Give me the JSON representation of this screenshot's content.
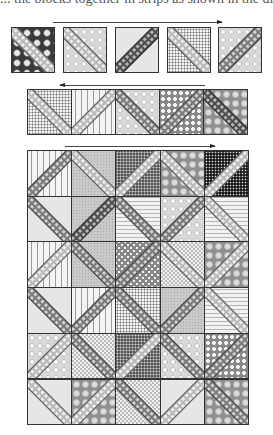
{
  "caption": "... the blocks together in strips as shown in the diagram ...",
  "arrows": [
    {
      "id": "row1",
      "direction": "right",
      "x": 53,
      "y": 22,
      "length": 169
    },
    {
      "id": "row2",
      "direction": "left",
      "x": 60,
      "y": 85,
      "length": 145
    },
    {
      "id": "row3",
      "direction": "right",
      "x": 65,
      "y": 146,
      "length": 150
    }
  ],
  "step1_blocks": [
    {
      "diag": "bwd",
      "bg": "p-floral-dark",
      "band": "b-floral-light"
    },
    {
      "diag": "bwd",
      "bg": "p-floral-light",
      "band": "b-floral-light"
    },
    {
      "diag": "fwd",
      "bg": "p-light",
      "band": "b-floral-dark"
    },
    {
      "diag": "bwd",
      "bg": "p-dots",
      "band": "b-floral-light"
    },
    {
      "diag": "fwd",
      "bg": "p-floral-light",
      "band": "b-floral"
    }
  ],
  "step2_strip": [
    {
      "diag": "bwd",
      "bg": "p-dots",
      "band": "b-floral-light"
    },
    {
      "diag": "fwd",
      "bg": "p-stripes",
      "band": "b-floral-light"
    },
    {
      "diag": "bwd",
      "bg": "p-floral-light",
      "band": "b-floral"
    },
    {
      "diag": "fwd",
      "bg": "p-bigdots",
      "band": "b-floral"
    },
    {
      "diag": "bwd",
      "bg": "p-floral-mid",
      "band": "b-floral-dark"
    }
  ],
  "quilt_grid": {
    "rows": 6,
    "cols": 5,
    "cells": [
      [
        {
          "diag": "fwd",
          "bg": "p-stripes",
          "band": "b-floral"
        },
        {
          "diag": "bwd",
          "bg": "p-grey",
          "band": "b-floral-light"
        },
        {
          "diag": "fwd",
          "bg": "p-darkdots",
          "band": "b-floral-light"
        },
        {
          "diag": "bwd",
          "bg": "p-floral-mid",
          "band": "b-floral-light"
        },
        {
          "diag": "fwd",
          "bg": "p-blackdots",
          "band": "b-floral-light"
        }
      ],
      [
        {
          "diag": "bwd",
          "bg": "p-light",
          "band": "b-floral"
        },
        {
          "diag": "fwd",
          "bg": "p-grey",
          "band": "b-floral-dark"
        },
        {
          "diag": "bwd",
          "bg": "p-hstripes",
          "band": "b-floral"
        },
        {
          "diag": "fwd",
          "bg": "p-floral-light",
          "band": "b-floral"
        },
        {
          "diag": "bwd",
          "bg": "p-hstripes",
          "band": "b-floral-light"
        }
      ],
      [
        {
          "diag": "fwd",
          "bg": "p-stripes",
          "band": "b-floral-light"
        },
        {
          "diag": "bwd",
          "bg": "p-grey",
          "band": "b-floral"
        },
        {
          "diag": "fwd",
          "bg": "p-lattice",
          "band": "b-floral"
        },
        {
          "diag": "bwd",
          "bg": "p-checker",
          "band": "b-floral-light"
        },
        {
          "diag": "fwd",
          "bg": "p-floral-mid",
          "band": "b-floral-light"
        }
      ],
      [
        {
          "diag": "bwd",
          "bg": "p-light",
          "band": "b-floral"
        },
        {
          "diag": "fwd",
          "bg": "p-stripes",
          "band": "b-floral"
        },
        {
          "diag": "bwd",
          "bg": "p-dots",
          "band": "b-floral"
        },
        {
          "diag": "fwd",
          "bg": "p-grey",
          "band": "b-floral"
        },
        {
          "diag": "bwd",
          "bg": "p-hstripes",
          "band": "b-floral-light"
        }
      ],
      [
        {
          "diag": "fwd",
          "bg": "p-floral-light",
          "band": "b-floral-light"
        },
        {
          "diag": "bwd",
          "bg": "p-checker",
          "band": "b-floral"
        },
        {
          "diag": "fwd",
          "bg": "p-darkdots",
          "band": "b-floral-light"
        },
        {
          "diag": "bwd",
          "bg": "p-floral-light",
          "band": "b-floral"
        },
        {
          "diag": "fwd",
          "bg": "p-bigdots",
          "band": "b-floral"
        }
      ],
      [
        {
          "diag": "bwd",
          "bg": "p-light",
          "band": "b-floral-light"
        },
        {
          "diag": "fwd",
          "bg": "p-floral-mid",
          "band": "b-floral-light"
        },
        {
          "diag": "bwd",
          "bg": "p-checker",
          "band": "b-floral"
        },
        {
          "diag": "fwd",
          "bg": "p-light",
          "band": "b-floral-light"
        },
        {
          "diag": "bwd",
          "bg": "p-floral-mid",
          "band": "b-floral"
        }
      ]
    ]
  },
  "colors": {
    "outline": "#333333",
    "arrow": "#444444",
    "background": "#ffffff"
  }
}
